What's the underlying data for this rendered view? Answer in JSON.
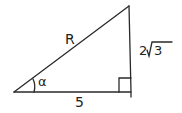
{
  "diagram": {
    "labels": {
      "hypotenuse": "R",
      "vertical_side_coeff": "2",
      "vertical_side_radicand": "3",
      "base": "5",
      "angle": "α"
    },
    "right_angle_marker": true,
    "ink_color": "#2a2a2a"
  }
}
